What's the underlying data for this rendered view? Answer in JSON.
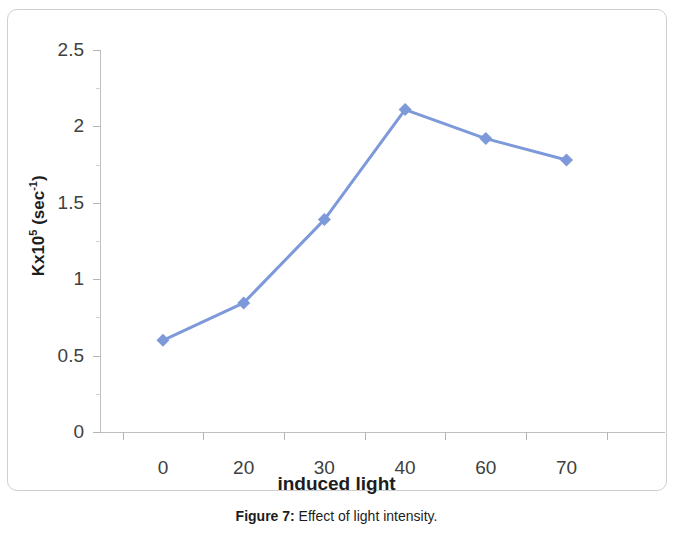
{
  "figure": {
    "caption_label": "Figure 7:",
    "caption_text": "Effect of light intensity."
  },
  "chart_data": {
    "type": "line",
    "title": "",
    "xlabel": "induced light",
    "ylabel": "Kx10⁵ (sec⁻¹)",
    "ylabel_parts": {
      "base": "Kx10",
      "base_sup": "5",
      "unit_open": " (sec",
      "unit_sup": "-1",
      "unit_close": ")"
    },
    "categories": [
      "0",
      "20",
      "30",
      "40",
      "60",
      "70"
    ],
    "values": [
      0.6,
      0.845,
      1.39,
      2.11,
      1.92,
      1.78
    ],
    "ylim": [
      0,
      2.5
    ],
    "ytick_labels": [
      "2.5",
      "2",
      "1.5",
      "1",
      "0.5",
      "0"
    ],
    "ytick_values": [
      2.5,
      2,
      1.5,
      1,
      0.5,
      0
    ],
    "yminor_values": [
      2.25,
      1.75,
      1.25,
      0.75,
      0.25
    ],
    "grid": false,
    "legend": "none",
    "series_color": "#7D99D9",
    "marker": "diamond",
    "marker_color": "#7D99D9",
    "axis_color": "#bfbfbf"
  }
}
